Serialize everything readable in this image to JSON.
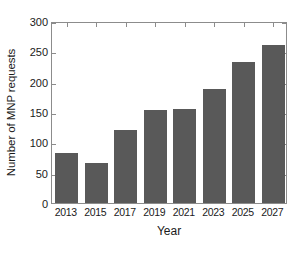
{
  "chart_data": {
    "type": "bar",
    "title": "",
    "subtitle": "",
    "xlabel": "Year",
    "ylabel": "Number of MNP requests",
    "categories": [
      "2013",
      "2015",
      "2017",
      "2019",
      "2021",
      "2023",
      "2025",
      "2027"
    ],
    "values": [
      83,
      66,
      121,
      153,
      155,
      188,
      233,
      261
    ],
    "series": [
      {
        "name": "MNP requests",
        "values": [
          83,
          66,
          121,
          153,
          155,
          188,
          233,
          261
        ]
      }
    ],
    "ylim": [
      0,
      300
    ],
    "yticks": [
      0,
      50,
      100,
      150,
      200,
      250,
      300
    ],
    "ytick_labels": [
      "0",
      "50",
      "100",
      "150",
      "200",
      "250",
      "300"
    ],
    "xtick_labels": [
      "2013",
      "2015",
      "2017",
      "2019",
      "2021",
      "2023",
      "2025",
      "2027"
    ],
    "grid": false,
    "legend": false,
    "legend_position": "none",
    "annotations": [],
    "bar_color": "#595959",
    "axis_color": "#8c8c8c",
    "text_color": "#1a1a1a",
    "background_color": "#ffffff",
    "box_border": true,
    "tick_direction": "in",
    "bar_width_ratio": 0.78
  }
}
